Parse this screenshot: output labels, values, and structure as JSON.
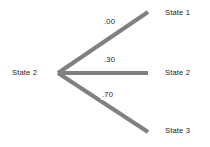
{
  "diagram": {
    "type": "state-transition-fan",
    "width": 210,
    "height": 147,
    "background_color": "#ffffff",
    "branch_color": "#808080",
    "text_color": "#1b1b1b",
    "source": {
      "label": "State 2",
      "x": 58,
      "y": 73
    },
    "branches": [
      {
        "probability_label": ".00",
        "probability_value": 0.0,
        "target_label": "State 1",
        "start_x": 58,
        "start_y": 73,
        "end_x": 148,
        "end_y": 12
      },
      {
        "probability_label": ".30",
        "probability_value": 0.3,
        "target_label": "State 2",
        "start_x": 58,
        "start_y": 73,
        "end_x": 148,
        "end_y": 73
      },
      {
        "probability_label": ".70",
        "probability_value": 0.7,
        "target_label": "State 3",
        "start_x": 58,
        "start_y": 73,
        "end_x": 148,
        "end_y": 132
      }
    ]
  }
}
